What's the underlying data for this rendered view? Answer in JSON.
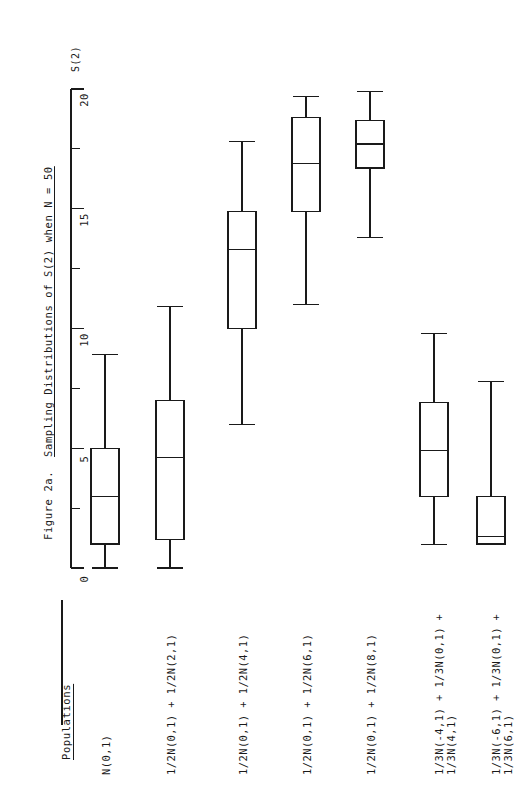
{
  "figure": {
    "title_lead": "Figure 2a.",
    "title_main": "Sampling Distributions of S(2) when N = 50",
    "axis_name": "S(2)",
    "group_axis_title": "Populations",
    "sample_size_note": "N = 50"
  },
  "chart_data": {
    "type": "box",
    "xlabel": "Populations",
    "ylabel": "S(2)",
    "orientation": "vertical",
    "grid": false,
    "legend": null,
    "ylim": [
      0,
      20
    ],
    "yticks": [
      0,
      5,
      10,
      15,
      20
    ],
    "ytick_labels": [
      "0",
      "5",
      "10",
      "15",
      "20"
    ],
    "minor_yticks": [
      2.5,
      7.5,
      12.5,
      17.5
    ],
    "categories": [
      "N(0,1)",
      "1/2N(0,1) + 1/2N(2,1)",
      "1/2N(0,1) + 1/2N(4,1)",
      "1/2N(0,1) + 1/2N(6,1)",
      "1/2N(0,1) + 1/2N(8,1)",
      "1/3N(-4,1) + 1/3N(0,1) + 1/3N(4,1)",
      "1/3N(-6,1) + 1/3N(0,1) + 1/3N(6,1)"
    ],
    "category_lines": [
      [
        "N(0,1)"
      ],
      [
        "1/2N(0,1) + 1/2N(2,1)"
      ],
      [
        "1/2N(0,1) + 1/2N(4,1)"
      ],
      [
        "1/2N(0,1) + 1/2N(6,1)"
      ],
      [
        "1/2N(0,1) + 1/2N(8,1)"
      ],
      [
        "1/3N(-4,1) + 1/3N(0,1) +",
        "1/3N(4,1)"
      ],
      [
        "1/3N(-6,1) + 1/3N(0,1) +",
        "1/3N(6,1)"
      ]
    ],
    "boxes": [
      {
        "name": "N(0,1)",
        "whisker_low": 0.0,
        "q1": 1.0,
        "median": 3.0,
        "q3": 5.0,
        "whisker_high": 8.9
      },
      {
        "name": "1/2N(0,1) + 1/2N(2,1)",
        "whisker_low": 0.0,
        "q1": 1.2,
        "median": 4.6,
        "q3": 7.0,
        "whisker_high": 10.9
      },
      {
        "name": "1/2N(0,1) + 1/2N(4,1)",
        "whisker_low": 6.0,
        "q1": 10.0,
        "median": 13.3,
        "q3": 14.9,
        "whisker_high": 17.8
      },
      {
        "name": "1/2N(0,1) + 1/2N(6,1)",
        "whisker_low": 11.0,
        "q1": 14.9,
        "median": 16.9,
        "q3": 18.8,
        "whisker_high": 19.7
      },
      {
        "name": "1/2N(0,1) + 1/2N(8,1)",
        "whisker_low": 13.8,
        "q1": 16.7,
        "median": 17.7,
        "q3": 18.7,
        "whisker_high": 19.9
      },
      {
        "name": "1/3N(-4,1)+1/3N(0,1)+1/3N(4,1)",
        "whisker_low": 1.0,
        "q1": 3.0,
        "median": 4.9,
        "q3": 6.9,
        "whisker_high": 9.8
      },
      {
        "name": "1/3N(-6,1)+1/3N(0,1)+1/3N(6,1)",
        "whisker_low": 1.0,
        "q1": 1.0,
        "median": 1.3,
        "q3": 3.0,
        "whisker_high": 7.8
      }
    ],
    "colors": {
      "line": "#1a1a1a",
      "fill": "#ffffff",
      "background": "#ffffff"
    }
  }
}
